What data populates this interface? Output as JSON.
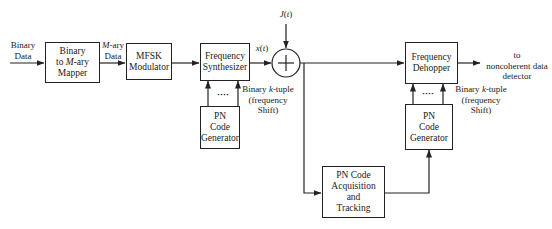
{
  "diagram": {
    "type": "block-diagram"
  },
  "labels": {
    "binary_data_input": "Binary\nData",
    "mary_data": "M-ary\nData",
    "x_t": "x(t)",
    "j_t": "J(t)",
    "ktuple_left": "Binary k-tuple\n(frequency\nShift)",
    "ktuple_right": "Binary k-tuple\n(frequency\nShift)",
    "output": "to\nnoncoherent data\ndetector",
    "dots_left": "····",
    "dots_right": "····"
  },
  "blocks": {
    "mapper": "Binary\nto M-ary\nMapper",
    "modulator": "MFSK\nModulator",
    "synthesizer": "Frequency\nSynthesizer",
    "adder": "+",
    "pn_gen_tx": "PN\nCode\nGenerator",
    "dehopper": "Frequency\nDehopper",
    "pn_gen_rx": "PN\nCode\nGenerator",
    "acquisition": "PN Code\nAcquisition\nand\nTracking"
  },
  "colors": {
    "line": "#222222",
    "background": "#ffffff"
  }
}
